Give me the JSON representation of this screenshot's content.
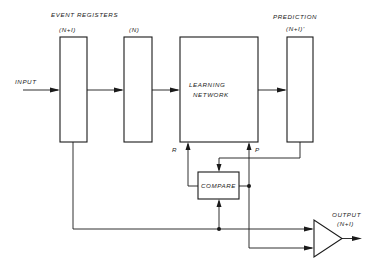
{
  "diagram": {
    "header_label": "EVENT  REGISTERS",
    "input_label": "INPUT",
    "registers": [
      {
        "id": "reg_n_plus_1",
        "label": "(N+I)"
      },
      {
        "id": "reg_n",
        "label": "(N)"
      }
    ],
    "learning_network": {
      "line1": "LEARNING",
      "line2": "NETWORK"
    },
    "prediction": {
      "title": "PREDICTION",
      "label": "(N+I)'"
    },
    "compare_label": "COMPARE",
    "r_label": "R",
    "p_label": "P",
    "output": {
      "title": "OUTPUT",
      "label": "(N+I)"
    },
    "colors": {
      "ink": "#1a1a1a",
      "background": "#ffffff"
    }
  }
}
